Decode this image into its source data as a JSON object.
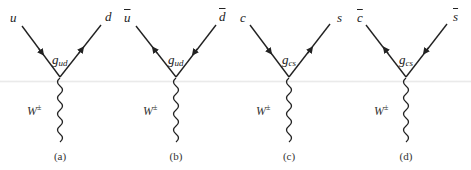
{
  "figure": {
    "line_color": "#222222",
    "diagrams": [
      {
        "id": "a",
        "caption": "(a)",
        "left_particle": "u",
        "left_antiparticle": false,
        "right_particle": "d",
        "right_antiparticle": false,
        "coupling_base": "g",
        "coupling_sub": "ud",
        "boson_base": "W",
        "boson_sup": "±",
        "left_arrow": "toward-vertex",
        "right_arrow": "away-from-vertex"
      },
      {
        "id": "b",
        "caption": "(b)",
        "left_particle": "u",
        "left_antiparticle": true,
        "right_particle": "d",
        "right_antiparticle": true,
        "coupling_base": "g",
        "coupling_sub": "ud",
        "boson_base": "W",
        "boson_sup": "±",
        "left_arrow": "away-from-vertex",
        "right_arrow": "toward-vertex"
      },
      {
        "id": "c",
        "caption": "(c)",
        "left_particle": "c",
        "left_antiparticle": false,
        "right_particle": "s",
        "right_antiparticle": false,
        "coupling_base": "g",
        "coupling_sub": "cs",
        "boson_base": "W",
        "boson_sup": "±",
        "left_arrow": "toward-vertex",
        "right_arrow": "away-from-vertex"
      },
      {
        "id": "d",
        "caption": "(d)",
        "left_particle": "c",
        "left_antiparticle": true,
        "right_particle": "s",
        "right_antiparticle": true,
        "coupling_base": "g",
        "coupling_sub": "cs",
        "boson_base": "W",
        "boson_sup": "±",
        "left_arrow": "away-from-vertex",
        "right_arrow": "toward-vertex"
      }
    ]
  }
}
